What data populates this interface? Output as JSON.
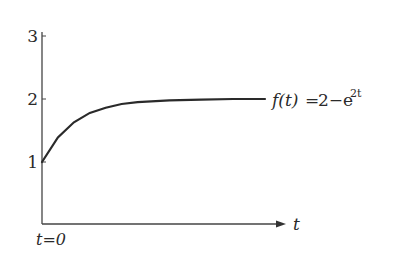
{
  "chart_data": {
    "type": "line",
    "title": "",
    "xlabel": "t",
    "ylabel": "",
    "x_origin_label": "t=0",
    "yticks": [
      1,
      2,
      3
    ],
    "ylim": [
      0,
      3
    ],
    "xlim": [
      0,
      3.5
    ],
    "grid": false,
    "legend": null,
    "series": [
      {
        "name": "f(t)",
        "label_as_printed": "f(t)=2−e^{2t}",
        "label_parts": {
          "lhs": "f(t)",
          "eq": "=",
          "rhs_base": "2−e",
          "rhs_exp": "2t"
        },
        "x": [
          0,
          0.25,
          0.5,
          0.75,
          1.0,
          1.25,
          1.5,
          2.0,
          2.5,
          3.0,
          3.5
        ],
        "y": [
          1.0,
          1.39,
          1.63,
          1.78,
          1.86,
          1.92,
          1.95,
          1.98,
          1.99,
          2.0,
          2.0
        ]
      }
    ],
    "annotations": [
      {
        "text": "f(t)=2−e^{2t}",
        "position": "right end of curve"
      },
      {
        "text": "t=0",
        "position": "below origin"
      },
      {
        "text": "t",
        "position": "right of x-axis arrow"
      },
      {
        "text": "label/curve mismatch",
        "note": "Printed label is 2−e^{2t} (positive exponent), which would decrease without bound from 1. The plotted curve rises from 1 toward the asymptote 2, consistent with 2−e^{−2t}. The label is reproduced as printed; the data points follow the plotted curve."
      }
    ]
  },
  "labels": {
    "y3": "3",
    "y2": "2",
    "y1": "1",
    "x_axis": "t",
    "origin": "t=0",
    "func_lhs": "f(t)",
    "func_eq": "=",
    "func_rhs": "2−e",
    "func_exp": "2t"
  },
  "colors": {
    "axis": "#444444",
    "curve": "#2a2a2a",
    "text": "#2a2a2a"
  }
}
